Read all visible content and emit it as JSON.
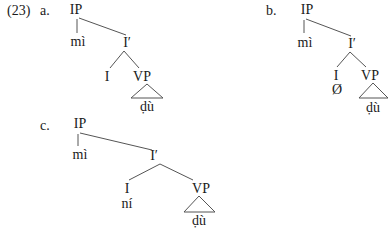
{
  "example_number": "(23)",
  "trees": [
    {
      "label": "a.",
      "root": "IP",
      "spec": "mì",
      "bar": "I′",
      "head": "I",
      "head_content": "",
      "complement": "VP",
      "complement_content": "ḍù"
    },
    {
      "label": "b.",
      "root": "IP",
      "spec": "mì",
      "bar": "I′",
      "head": "I",
      "head_content": "Ø",
      "complement": "VP",
      "complement_content": "ḍù"
    },
    {
      "label": "c.",
      "root": "IP",
      "spec": "mì",
      "bar": "I′",
      "head": "I",
      "head_content": "ní",
      "complement": "VP",
      "complement_content": "ḍù"
    }
  ],
  "colors": {
    "ink": "#1a1a1a",
    "lines": "#555555"
  }
}
